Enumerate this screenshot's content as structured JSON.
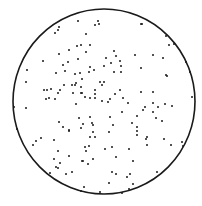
{
  "chart_data": {
    "type": "scatter",
    "title": "",
    "xlabel": "",
    "ylabel": "",
    "grid": false,
    "legend": null,
    "boundary": {
      "shape": "circle",
      "cx": 104,
      "cy": 101.5,
      "rx": 91,
      "ry": 92.5,
      "color": "#1a1a1a"
    },
    "point_color": "#1a1a1a",
    "point_radius": 1.0,
    "coordinate_space": "pixels (0-202 x, 0-206 y), origin top-left",
    "points": [
      [
        59,
        27
      ],
      [
        58,
        30
      ],
      [
        55,
        33
      ],
      [
        78,
        21
      ],
      [
        98,
        21
      ],
      [
        99,
        24
      ],
      [
        95,
        25
      ],
      [
        141,
        24
      ],
      [
        142,
        24
      ],
      [
        77,
        46
      ],
      [
        81,
        45
      ],
      [
        59,
        54
      ],
      [
        69,
        50
      ],
      [
        43,
        61
      ],
      [
        78,
        59
      ],
      [
        63,
        65
      ],
      [
        68,
        62
      ],
      [
        27,
        70
      ],
      [
        56,
        73
      ],
      [
        65,
        71
      ],
      [
        75,
        74
      ],
      [
        80,
        73
      ],
      [
        86,
        34
      ],
      [
        90,
        45
      ],
      [
        86,
        52
      ],
      [
        114,
        51
      ],
      [
        116,
        56
      ],
      [
        135,
        55
      ],
      [
        106,
        58
      ],
      [
        120,
        61
      ],
      [
        111,
        63
      ],
      [
        104,
        66
      ],
      [
        121,
        66
      ],
      [
        90,
        67
      ],
      [
        141,
        68
      ],
      [
        94,
        70
      ],
      [
        89,
        72
      ],
      [
        114,
        72
      ],
      [
        121,
        72
      ],
      [
        166,
        36
      ],
      [
        169,
        45
      ],
      [
        174,
        44
      ],
      [
        153,
        55
      ],
      [
        163,
        58
      ],
      [
        186,
        62
      ],
      [
        190,
        72
      ],
      [
        166,
        75
      ],
      [
        26,
        82
      ],
      [
        44,
        90
      ],
      [
        47,
        90
      ],
      [
        51,
        89
      ],
      [
        64,
        85
      ],
      [
        60,
        90
      ],
      [
        58,
        93
      ],
      [
        72,
        85
      ],
      [
        76,
        83
      ],
      [
        75,
        85
      ],
      [
        81,
        87
      ],
      [
        73,
        93
      ],
      [
        46,
        99
      ],
      [
        49,
        98
      ],
      [
        55,
        99
      ],
      [
        81,
        93
      ],
      [
        76,
        104
      ],
      [
        26,
        108
      ],
      [
        14,
        107
      ],
      [
        59,
        122
      ],
      [
        63,
        127
      ],
      [
        69,
        130
      ],
      [
        79,
        118
      ],
      [
        81,
        128
      ],
      [
        17,
        129
      ],
      [
        82,
        79
      ],
      [
        100,
        82
      ],
      [
        104,
        82
      ],
      [
        102,
        85
      ],
      [
        95,
        90
      ],
      [
        82,
        93
      ],
      [
        85,
        97
      ],
      [
        90,
        98
      ],
      [
        95,
        94
      ],
      [
        95,
        98
      ],
      [
        102,
        101
      ],
      [
        110,
        99
      ],
      [
        108,
        102
      ],
      [
        115,
        94
      ],
      [
        120,
        90
      ],
      [
        123,
        98
      ],
      [
        128,
        103
      ],
      [
        141,
        92
      ],
      [
        145,
        107
      ],
      [
        143,
        110
      ],
      [
        122,
        112
      ],
      [
        137,
        116
      ],
      [
        110,
        117
      ],
      [
        90,
        117
      ],
      [
        92,
        123
      ],
      [
        93,
        125
      ],
      [
        83,
        124
      ],
      [
        113,
        125
      ],
      [
        132,
        123
      ],
      [
        137,
        127
      ],
      [
        167,
        76
      ],
      [
        153,
        92
      ],
      [
        192,
        97
      ],
      [
        153,
        103
      ],
      [
        158,
        107
      ],
      [
        165,
        104
      ],
      [
        172,
        106
      ],
      [
        153,
        112
      ],
      [
        156,
        118
      ],
      [
        162,
        121
      ],
      [
        69,
        131
      ],
      [
        41,
        138
      ],
      [
        36,
        141
      ],
      [
        33,
        145
      ],
      [
        54,
        140
      ],
      [
        58,
        151
      ],
      [
        69,
        156
      ],
      [
        54,
        159
      ],
      [
        60,
        163
      ],
      [
        56,
        167
      ],
      [
        58,
        168
      ],
      [
        50,
        173
      ],
      [
        66,
        174
      ],
      [
        72,
        172
      ],
      [
        82,
        161
      ],
      [
        81,
        191
      ],
      [
        93,
        132
      ],
      [
        109,
        132
      ],
      [
        137,
        131
      ],
      [
        137,
        135
      ],
      [
        147,
        137
      ],
      [
        95,
        137
      ],
      [
        90,
        137
      ],
      [
        85,
        147
      ],
      [
        89,
        146
      ],
      [
        86,
        151
      ],
      [
        112,
        147
      ],
      [
        105,
        149
      ],
      [
        129,
        149
      ],
      [
        147,
        145
      ],
      [
        116,
        157
      ],
      [
        93,
        159
      ],
      [
        83,
        161
      ],
      [
        88,
        164
      ],
      [
        133,
        161
      ],
      [
        112,
        172
      ],
      [
        116,
        174
      ],
      [
        130,
        174
      ],
      [
        127,
        177
      ],
      [
        109,
        183
      ],
      [
        133,
        184
      ],
      [
        84,
        187
      ],
      [
        129,
        189
      ],
      [
        100,
        192
      ],
      [
        122,
        193
      ],
      [
        146,
        139
      ],
      [
        164,
        139
      ],
      [
        171,
        145
      ],
      [
        182,
        142
      ],
      [
        183,
        146
      ],
      [
        157,
        172
      ]
    ]
  }
}
